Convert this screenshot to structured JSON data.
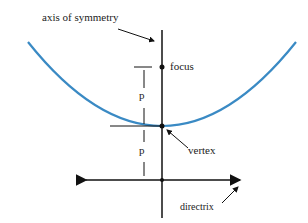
{
  "diagram": {
    "labels": {
      "axis": "axis of symmetry",
      "focus": "focus",
      "vertex": "vertex",
      "directrix": "directrix",
      "p_upper": "p",
      "p_lower": "p"
    },
    "colors": {
      "parabola": "#3a8ac4",
      "lines": "#111111"
    }
  }
}
